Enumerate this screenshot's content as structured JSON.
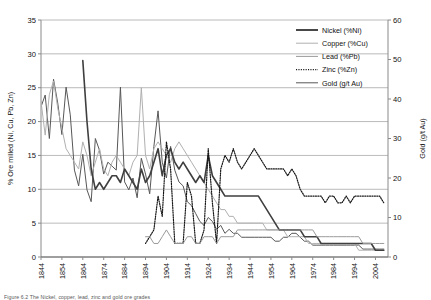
{
  "chart_data": {
    "type": "line",
    "title": "",
    "xlabel": "",
    "ylabel": "% Ore milled (Ni, Cu, Pb, Zn)",
    "y2label": "Gold (g/t Au)",
    "xlim": [
      1844,
      2010
    ],
    "ylim": [
      0,
      35
    ],
    "y2lim": [
      0,
      60
    ],
    "yticks": [
      0,
      5,
      10,
      15,
      20,
      25,
      30,
      35
    ],
    "y2ticks": [
      0,
      10,
      20,
      30,
      40,
      50,
      60
    ],
    "xticks": [
      1844,
      1854,
      1864,
      1874,
      1884,
      1894,
      1904,
      1914,
      1924,
      1934,
      1944,
      1954,
      1964,
      1974,
      1984,
      1994,
      2004
    ],
    "grid": true,
    "legend_position": "top-right",
    "legend": [
      {
        "label": "Nickel (%Ni)",
        "color": "#3f3f3f",
        "style": "solid",
        "width": 1.9
      },
      {
        "label": "Copper (%Cu)",
        "color": "#b0b0b0",
        "style": "solid",
        "width": 1.0
      },
      {
        "label": "Lead (%Pb)",
        "color": "#9a9a9a",
        "style": "solid",
        "width": 1.0
      },
      {
        "label": "Zinc (%Zn)",
        "color": "#161616",
        "style": "dotted",
        "width": 1.2
      },
      {
        "label": "Gold (g/t Au)",
        "color": "#575757",
        "style": "solid",
        "width": 1.0
      }
    ],
    "series": [
      {
        "name": "Gold (g/t Au)",
        "axis": "right",
        "color": "#575757",
        "style": "solid",
        "x": [
          1844,
          1846,
          1848,
          1850,
          1852,
          1854,
          1856,
          1858,
          1860,
          1862,
          1864,
          1866,
          1868,
          1870,
          1872,
          1874,
          1876,
          1878,
          1880,
          1882,
          1884,
          1886,
          1888,
          1890,
          1892,
          1894,
          1896,
          1898,
          1900,
          1902,
          1904,
          1906,
          1908,
          1910,
          1912,
          1914,
          1916,
          1918,
          1920,
          1922,
          1924,
          1926,
          1928,
          1930,
          1932,
          1934,
          1936,
          1938,
          1940,
          1942,
          1944,
          1946,
          1948,
          1950,
          1952,
          1954,
          1956,
          1958,
          1960,
          1962,
          1964,
          1966,
          1968,
          1970,
          1972,
          1974,
          1976,
          1978,
          1980,
          1982,
          1984,
          1986,
          1988,
          1990,
          1992,
          1994,
          1996,
          1998,
          2000,
          2002,
          2004,
          2006,
          2008
        ],
        "values": [
          38,
          41,
          30,
          45,
          39,
          31,
          43,
          36,
          22,
          18,
          26,
          17,
          14,
          30,
          27,
          21,
          24,
          23,
          22,
          43,
          19,
          17,
          20,
          15,
          25,
          21,
          16,
          28,
          37,
          24,
          20,
          28,
          22,
          19,
          18,
          14,
          13,
          11,
          9,
          8,
          10,
          9,
          7,
          8,
          6,
          7,
          6,
          6,
          5,
          5,
          5,
          5,
          5,
          5,
          5,
          5,
          4,
          4,
          5,
          5,
          6,
          6,
          5,
          4,
          4,
          3,
          3,
          3,
          3,
          3,
          3,
          3,
          3,
          3,
          3,
          3,
          3,
          2,
          2,
          2,
          2,
          2,
          2
        ]
      },
      {
        "name": "Copper (%Cu)",
        "axis": "left",
        "color": "#b0b0b0",
        "style": "solid",
        "x": [
          1844,
          1846,
          1848,
          1850,
          1852,
          1854,
          1856,
          1858,
          1860,
          1862,
          1864,
          1866,
          1868,
          1870,
          1872,
          1874,
          1876,
          1878,
          1880,
          1882,
          1884,
          1886,
          1888,
          1890,
          1892,
          1894,
          1896,
          1898,
          1900,
          1902,
          1904,
          1906,
          1908,
          1910,
          1912,
          1914,
          1916,
          1918,
          1920,
          1922,
          1924,
          1926,
          1928,
          1930,
          1932,
          1934,
          1936,
          1938,
          1940,
          1942,
          1944,
          1946,
          1948,
          1950,
          1952,
          1954,
          1956,
          1958,
          1960,
          1962,
          1964,
          1966,
          1968,
          1970,
          1972,
          1974,
          1976,
          1978,
          1980,
          1982,
          1984,
          1986,
          1988,
          1990,
          1992,
          1994,
          1996,
          1998,
          2000,
          2002,
          2004,
          2006,
          2008
        ],
        "values": [
          23,
          18,
          24,
          26,
          22,
          19,
          16,
          15,
          14,
          13,
          17,
          15,
          12,
          14,
          16,
          13,
          12,
          14,
          15,
          14,
          13,
          12,
          14,
          15,
          25,
          15,
          13,
          16,
          17,
          16,
          15,
          14,
          16,
          17,
          16,
          15,
          14,
          13,
          12,
          11,
          10,
          9,
          8,
          7,
          7,
          6,
          6,
          5,
          5,
          5,
          5,
          5,
          5,
          5,
          4,
          4,
          4,
          4,
          4,
          3,
          3,
          3,
          3,
          3,
          2,
          2,
          2,
          2,
          2,
          2,
          2,
          2,
          2,
          2,
          2,
          2,
          1,
          1,
          1,
          1,
          1,
          1,
          1
        ]
      },
      {
        "name": "Nickel (%Ni)",
        "axis": "left",
        "color": "#3f3f3f",
        "style": "solid",
        "x": [
          1864,
          1866,
          1868,
          1870,
          1872,
          1874,
          1876,
          1878,
          1880,
          1882,
          1884,
          1886,
          1888,
          1890,
          1892,
          1894,
          1896,
          1898,
          1900,
          1902,
          1904,
          1906,
          1908,
          1910,
          1912,
          1914,
          1916,
          1918,
          1920,
          1922,
          1924,
          1926,
          1928,
          1930,
          1932,
          1934,
          1936,
          1938,
          1940,
          1942,
          1944,
          1946,
          1948,
          1950,
          1952,
          1954,
          1956,
          1958,
          1960,
          1962,
          1964,
          1966,
          1968,
          1970,
          1972,
          1974,
          1976,
          1978,
          1980,
          1982,
          1984,
          1986,
          1988,
          1990,
          1992,
          1994,
          1996,
          1998,
          2000,
          2002,
          2004,
          2006,
          2008
        ],
        "values": [
          29,
          20,
          13,
          10,
          11,
          10,
          11,
          12,
          12,
          11,
          13,
          12,
          11,
          10,
          13,
          11,
          12,
          14,
          16,
          12,
          15,
          16,
          14,
          13,
          14,
          13,
          12,
          11,
          12,
          11,
          15,
          12,
          11,
          10,
          9,
          9,
          9,
          9,
          9,
          9,
          9,
          9,
          9,
          8,
          7,
          6,
          5,
          4,
          4,
          4,
          4,
          4,
          4,
          3,
          3,
          3,
          3,
          2,
          2,
          2,
          2,
          2,
          2,
          2,
          2,
          2,
          2,
          2,
          2,
          2,
          1,
          1,
          1
        ]
      },
      {
        "name": "Zinc (%Zn)",
        "axis": "left",
        "color": "#161616",
        "style": "dotted",
        "x": [
          1894,
          1896,
          1898,
          1900,
          1902,
          1904,
          1906,
          1908,
          1910,
          1912,
          1914,
          1916,
          1918,
          1920,
          1922,
          1924,
          1926,
          1928,
          1930,
          1932,
          1934,
          1936,
          1938,
          1940,
          1942,
          1944,
          1946,
          1948,
          1950,
          1952,
          1954,
          1956,
          1958,
          1960,
          1962,
          1964,
          1966,
          1968,
          1970,
          1972,
          1974,
          1976,
          1978,
          1980,
          1982,
          1984,
          1986,
          1988,
          1990,
          1992,
          1994,
          1996,
          1998,
          2000,
          2002,
          2004,
          2006,
          2008
        ],
        "values": [
          2,
          3,
          4,
          9,
          6,
          17,
          13,
          2,
          2,
          2,
          11,
          9,
          2,
          2,
          4,
          16,
          8,
          2,
          13,
          15,
          14,
          16,
          14,
          13,
          14,
          15,
          16,
          15,
          14,
          13,
          13,
          13,
          13,
          13,
          12,
          13,
          12,
          10,
          9,
          9,
          9,
          9,
          9,
          8,
          9,
          9,
          8,
          8,
          9,
          8,
          9,
          9,
          9,
          9,
          9,
          9,
          9,
          8
        ]
      },
      {
        "name": "Lead (%Pb)",
        "axis": "left",
        "color": "#9a9a9a",
        "style": "solid",
        "x": [
          1894,
          1896,
          1898,
          1900,
          1902,
          1904,
          1906,
          1908,
          1910,
          1912,
          1914,
          1916,
          1918,
          1920,
          1922,
          1924,
          1926,
          1928,
          1930,
          1932,
          1934,
          1936,
          1938,
          1940,
          1942,
          1944,
          1946,
          1948,
          1950,
          1952,
          1954,
          1956,
          1958,
          1960,
          1962,
          1964,
          1966,
          1968,
          1970,
          1972,
          1974,
          1976,
          1978,
          1980,
          1982,
          1984,
          1986,
          1988,
          1990,
          1992,
          1994,
          1996,
          1998,
          2000,
          2002,
          2004,
          2006,
          2008
        ],
        "values": [
          3,
          3,
          2,
          2,
          3,
          4,
          3,
          2,
          2,
          2,
          3,
          3,
          2,
          2,
          3,
          3,
          3,
          2,
          3,
          3,
          3,
          3,
          4,
          4,
          4,
          4,
          4,
          4,
          4,
          4,
          4,
          4,
          4,
          4,
          4,
          4,
          4,
          4,
          4,
          4,
          4,
          3,
          3,
          3,
          3,
          3,
          3,
          3,
          3,
          3,
          3,
          3,
          2,
          2,
          2,
          2,
          2,
          2
        ]
      }
    ]
  },
  "caption": "Figure 6.2  The Nickel, copper, lead, zinc and gold ore grades"
}
